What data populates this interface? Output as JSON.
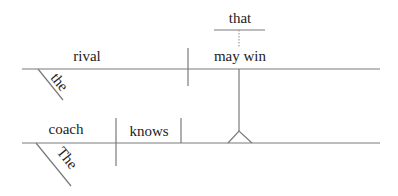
{
  "diagram": {
    "type": "Reed-Kellogg sentence diagram",
    "sentence": "The coach knows that the rival may win",
    "main_clause": {
      "subject": "coach",
      "subject_modifier": "The",
      "verb": "knows"
    },
    "noun_clause": {
      "connector": "that",
      "subject": "rival",
      "subject_modifier": "the",
      "verb": "may win"
    },
    "colors": {
      "line": "#7a7a7a",
      "text": "#222222",
      "background": "#ffffff"
    }
  }
}
